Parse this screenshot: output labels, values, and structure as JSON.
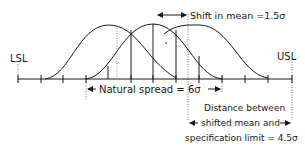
{
  "diagram": {
    "labels": {
      "lsl": "LSL",
      "usl": "USL",
      "shift": "Shift in mean =1.5σ",
      "natural_spread": "Natural spread = 6σ",
      "distance_line1": "Distance between",
      "distance_line2": "shifted mean and",
      "distance_line3": "specification limit = 4.5σ"
    },
    "curves": [
      {
        "name": "left-shifted-distribution",
        "mean_x": 108
      },
      {
        "name": "centered-distribution",
        "mean_x": 153
      },
      {
        "name": "right-shifted-distribution",
        "mean_x": 199
      }
    ],
    "axis": {
      "tick_count": 13
    },
    "colors": {
      "ink": "#1a1a1a",
      "background": "#ffffff"
    }
  }
}
